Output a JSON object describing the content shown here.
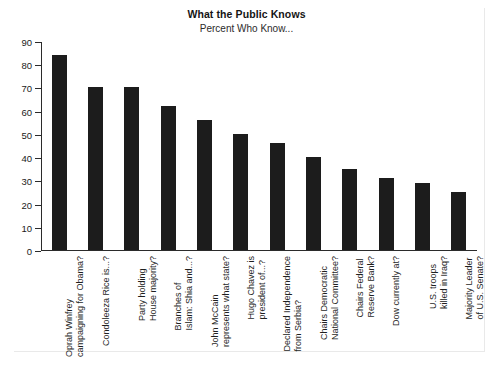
{
  "chart_data": {
    "type": "bar",
    "title": "What the Public Knows",
    "subtitle": "Percent Who Know...",
    "xlabel": "",
    "ylabel": "",
    "ylim": [
      0,
      90
    ],
    "yticks": [
      0,
      10,
      20,
      30,
      40,
      50,
      60,
      70,
      80,
      90
    ],
    "grid": false,
    "legend": null,
    "bar_color": "#1c1c1c",
    "categories": [
      "Oprah Winfrey campaigning for Obama?",
      "Condoleeza Rice is...?",
      "Party holding House majority?",
      "Branches of Islam: Shia and...?",
      "John McCain represents what state?",
      "Hugo Chavez is president of...?",
      "Declared Independence from Serbia?",
      "Chairs Democratic National Committee?",
      "Chairs Federal Reserve Bank?",
      "Dow currently at?",
      "U.S. troops killed in Iraq?",
      "Majority Leader of U.S. Senate?"
    ],
    "category_lines": [
      [
        "Oprah Winfrey",
        "campaigning for Obama?"
      ],
      [
        "Condoleeza Rice is...?",
        ""
      ],
      [
        "Party holding",
        "House majority?"
      ],
      [
        "Branches of",
        "Islam: Shia and...?"
      ],
      [
        "John McCain",
        "represents what state?"
      ],
      [
        "Hugo Chavez is",
        "president of...?"
      ],
      [
        "Declared Independence",
        "from Serbia?"
      ],
      [
        "Chairs Democratic",
        "National Committee?"
      ],
      [
        "Chairs Federal",
        "Reserve Bank?"
      ],
      [
        "Dow currently at?",
        ""
      ],
      [
        "U.S. troops",
        "killed in Iraq?"
      ],
      [
        "Majority Leader",
        "of U.S. Senate?"
      ]
    ],
    "values": [
      84,
      70,
      70,
      62,
      56,
      50,
      46,
      40,
      35,
      31,
      29,
      25
    ]
  }
}
